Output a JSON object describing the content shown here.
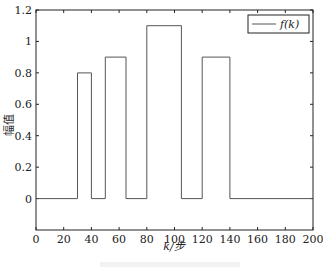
{
  "chart_data": {
    "type": "line",
    "title": "",
    "xlabel": "k/步",
    "ylabel": "幅值",
    "xlim": [
      0,
      200
    ],
    "ylim": [
      -0.2,
      1.2
    ],
    "xticks": [
      0,
      20,
      40,
      60,
      80,
      100,
      120,
      140,
      160,
      180,
      200
    ],
    "yticks": [
      0,
      0.2,
      0.4,
      0.6,
      0.8,
      1,
      1.2
    ],
    "ytick_labels": [
      "0",
      "0.2",
      "0.4",
      "0.6",
      "0.8",
      "1",
      "1.2"
    ],
    "grid": false,
    "legend_position": "upper right",
    "series": [
      {
        "name": "f(k)",
        "color": "#555555",
        "x": [
          0,
          30,
          30,
          40,
          40,
          50,
          50,
          65,
          65,
          80,
          80,
          105,
          105,
          120,
          120,
          140,
          140,
          200
        ],
        "y": [
          0,
          0,
          0.8,
          0.8,
          0,
          0,
          0.9,
          0.9,
          0,
          0,
          1.1,
          1.1,
          0,
          0,
          0.9,
          0.9,
          0,
          0
        ]
      }
    ]
  },
  "legend": {
    "label": "f(k)"
  },
  "axes": {
    "xlabel": "k/步",
    "ylabel": "幅值"
  }
}
